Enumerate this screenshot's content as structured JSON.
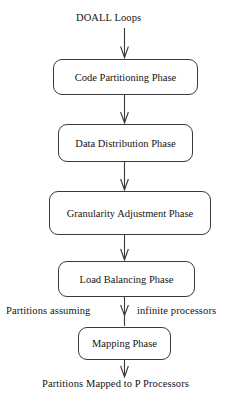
{
  "diagram": {
    "type": "flowchart",
    "orientation": "top-to-bottom",
    "stroke_color": "#3a3a3a",
    "text_color": "#141414",
    "background_color": "#ffffff",
    "input_label": "DOALL  Loops",
    "output_label": "Partitions  Mapped  to  P  Processors",
    "edge_annotation_left": "Partitions  assuming",
    "edge_annotation_right": "infinite  processors",
    "nodes": [
      {
        "id": "code-partitioning",
        "label": "Code   Partitioning Phase",
        "x": 53,
        "y": 59,
        "width": 145,
        "height": 36
      },
      {
        "id": "data-distribution",
        "label": "Data  Distribution  Phase",
        "x": 58,
        "y": 124,
        "width": 135,
        "height": 38
      },
      {
        "id": "granularity-adjustment",
        "label": "Granularity    Adjustment  Phase",
        "x": 49,
        "y": 191,
        "width": 162,
        "height": 44
      },
      {
        "id": "load-balancing",
        "label": "Load  Balancing  Phase",
        "x": 58,
        "y": 261,
        "width": 137,
        "height": 36
      },
      {
        "id": "mapping",
        "label": "Mapping  Phase",
        "x": 78,
        "y": 327,
        "width": 93,
        "height": 33
      }
    ],
    "edges": [
      {
        "id": "input-to-code-partitioning",
        "from": "input-label",
        "to": "code-partitioning"
      },
      {
        "id": "code-partitioning-to-data-distribution",
        "from": "code-partitioning",
        "to": "data-distribution"
      },
      {
        "id": "data-distribution-to-granularity",
        "from": "data-distribution",
        "to": "granularity-adjustment"
      },
      {
        "id": "granularity-to-load-balancing",
        "from": "granularity-adjustment",
        "to": "load-balancing"
      },
      {
        "id": "load-balancing-to-mapping",
        "from": "load-balancing",
        "to": "mapping"
      },
      {
        "id": "mapping-to-output",
        "from": "mapping",
        "to": "output-label"
      }
    ]
  }
}
